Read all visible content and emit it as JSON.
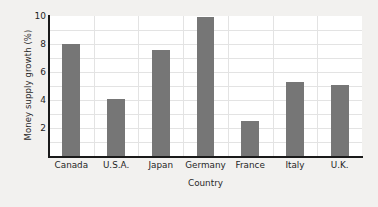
{
  "chart_data": {
    "type": "bar",
    "title": "",
    "xlabel": "Country",
    "ylabel": "Money supply growth (%)",
    "categories": [
      "Canada",
      "U.S.A.",
      "Japan",
      "Germany",
      "France",
      "Italy",
      "U.K."
    ],
    "values": [
      8.0,
      4.1,
      7.6,
      9.9,
      2.5,
      5.3,
      5.1
    ],
    "ylim": [
      0,
      10
    ],
    "xlim": [
      0,
      7
    ],
    "yticks": [
      2,
      4,
      6,
      8,
      10
    ],
    "ytick_labels": [
      "2",
      "4",
      "6",
      "8",
      "10"
    ],
    "gridlines_h": [
      1,
      2,
      3,
      4,
      5,
      6,
      7,
      8,
      9
    ],
    "grid": true,
    "legend": false,
    "bar_color": "#767676",
    "plot_background": "#ffffff",
    "figure_background": "#f2f1ef",
    "grid_color": "#e3e3e3",
    "axis_color": "#1a1a1a"
  }
}
